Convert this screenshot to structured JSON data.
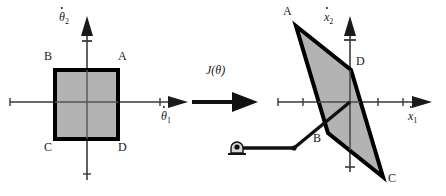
{
  "figure": {
    "transform_label": "J(",
    "transform_label_arg": "θ",
    "transform_label_close": ")",
    "colors": {
      "fill": "#b3b3b3",
      "stroke": "#000000",
      "axis": "#3a3a3a",
      "text": "#1a1a1a",
      "background": "#ffffff"
    }
  },
  "left_plot": {
    "name": "joint-velocity-space",
    "origin": {
      "x": 87,
      "y": 102
    },
    "axes": {
      "x": {
        "label_base": "θ",
        "label_sub": "1",
        "dotted": true,
        "x1": 10,
        "x2": 178,
        "tip": 186
      },
      "y": {
        "label_base": "θ",
        "label_sub": "2",
        "dotted": true,
        "y1": 178,
        "y2": 30,
        "tip": 22
      }
    },
    "tick_marks": [
      {
        "axis": "x",
        "pos": 10
      },
      {
        "axis": "x",
        "pos": 160
      },
      {
        "axis": "y",
        "pos": 172
      },
      {
        "axis": "y",
        "pos": 42
      }
    ],
    "square": {
      "x1": 55,
      "y1": 70,
      "x2": 118,
      "y2": 139
    },
    "vertices": [
      {
        "id": "A",
        "label": "A",
        "lx": 118,
        "ly": 58
      },
      {
        "id": "B",
        "label": "B",
        "lx": 50,
        "ly": 58
      },
      {
        "id": "C",
        "label": "C",
        "lx": 50,
        "ly": 146
      },
      {
        "id": "D",
        "label": "D",
        "lx": 118,
        "ly": 146
      }
    ]
  },
  "arrow": {
    "name": "transform-arrow",
    "x1": 192,
    "x2": 253,
    "y": 102,
    "label_x": 205,
    "label_y": 72
  },
  "right_plot": {
    "name": "end-effector-velocity-space",
    "origin": {
      "x": 350,
      "y": 102
    },
    "axes": {
      "x": {
        "label_base": "x",
        "label_sub": "1",
        "dotted": true,
        "x1": 278,
        "x2": 423,
        "tip": 431
      },
      "y": {
        "label_base": "x",
        "label_sub": "2",
        "dotted": true,
        "y1": 170,
        "y2": 30,
        "tip": 22
      }
    },
    "tick_marks": [
      {
        "axis": "x",
        "pos": 278
      },
      {
        "axis": "x",
        "pos": 303
      },
      {
        "axis": "x",
        "pos": 378
      },
      {
        "axis": "x",
        "pos": 403
      },
      {
        "axis": "y",
        "pos": 166
      },
      {
        "axis": "y",
        "pos": 40
      }
    ],
    "parallelogram": [
      {
        "id": "A",
        "x": 296,
        "y": 26
      },
      {
        "id": "D",
        "x": 351,
        "y": 70
      },
      {
        "id": "C",
        "x": 383,
        "y": 177
      },
      {
        "id": "B",
        "x": 328,
        "y": 133
      }
    ],
    "vertices": [
      {
        "id": "A",
        "label": "A",
        "lx": 285,
        "ly": 12
      },
      {
        "id": "D",
        "label": "D",
        "lx": 357,
        "ly": 62
      },
      {
        "id": "C",
        "label": "C",
        "lx": 389,
        "ly": 178
      },
      {
        "id": "B",
        "label": "B",
        "lx": 315,
        "ly": 137
      }
    ],
    "manipulator": {
      "name": "two-link-manipulator",
      "base": {
        "x": 236,
        "y": 148
      },
      "joint": {
        "x": 294,
        "y": 148
      },
      "tip": {
        "x": 350,
        "y": 102
      },
      "ground_icon": "pin-joint-ground"
    }
  }
}
